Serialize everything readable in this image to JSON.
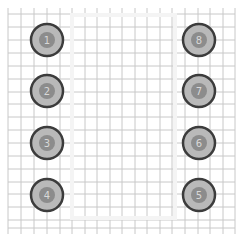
{
  "footprint": {
    "type": "DIP-8",
    "grid": {
      "color": "#c8c8c8",
      "x_lines": [
        8,
        21,
        34,
        47,
        60,
        72,
        85,
        97,
        110,
        122,
        135,
        147,
        160,
        172,
        185,
        198,
        210,
        223,
        235
      ],
      "y_lines": [
        14,
        27,
        40,
        53,
        66,
        79,
        92,
        104,
        117,
        130,
        143,
        156,
        169,
        182,
        194,
        207,
        220,
        228
      ],
      "x_min": 8,
      "x_max": 235,
      "y_min": 8,
      "y_max": 234
    },
    "outline": {
      "x": 72,
      "y": 15,
      "width": 103,
      "height": 203,
      "color": "#f4f4f4"
    },
    "pad_style": {
      "outer_radius": 16,
      "inner_radius": 8,
      "ring_color": "#3c3c3c",
      "fill_color": "#b9b9b9",
      "hole_color": "#8c8c8c",
      "label_color": "#d8d8d8"
    },
    "pads": [
      {
        "number": "1",
        "x": 47,
        "y": 40
      },
      {
        "number": "2",
        "x": 47,
        "y": 91
      },
      {
        "number": "3",
        "x": 47,
        "y": 143
      },
      {
        "number": "4",
        "x": 47,
        "y": 195
      },
      {
        "number": "5",
        "x": 199,
        "y": 195
      },
      {
        "number": "6",
        "x": 199,
        "y": 143
      },
      {
        "number": "7",
        "x": 199,
        "y": 91
      },
      {
        "number": "8",
        "x": 199,
        "y": 40
      }
    ]
  }
}
